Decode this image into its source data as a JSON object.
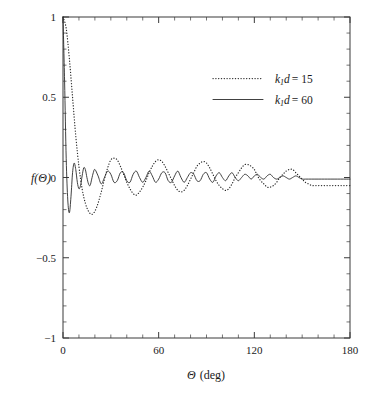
{
  "chart_data": {
    "type": "line",
    "title": "",
    "xlabel": "Θ (deg)",
    "xlabel_symbol": "Θ",
    "xlabel_unit": "(deg)",
    "ylabel": "f(Θ)",
    "xlim": [
      0,
      180
    ],
    "ylim": [
      -1,
      1
    ],
    "xticks": [
      0,
      60,
      120,
      180
    ],
    "xtick_labels": [
      "0",
      "60",
      "120",
      "180"
    ],
    "yticks": [
      -1,
      -0.5,
      0,
      0.5,
      1
    ],
    "ytick_labels": [
      "-1",
      "-0.5",
      "0",
      "0.5",
      "1"
    ],
    "x_minor_step": 10,
    "y_minor_step": 0.1,
    "grid": false,
    "tick_direction": "in",
    "legend_position": "upper right",
    "series": [
      {
        "name": "k1d = 15",
        "label_var": "k",
        "label_sub": "1",
        "label_var2": "d",
        "label_value": "= 15",
        "style": "dotted",
        "color": "#2b2b2b",
        "k1d": 15,
        "x": [
          0,
          2,
          4,
          6,
          8,
          10,
          12,
          14,
          16,
          18,
          20,
          22,
          24,
          26,
          28,
          30,
          32,
          34,
          36,
          38,
          40,
          42,
          44,
          46,
          48,
          50,
          52,
          54,
          56,
          58,
          60,
          62,
          64,
          66,
          68,
          70,
          72,
          74,
          76,
          78,
          80,
          82,
          84,
          86,
          88,
          90,
          92,
          94,
          96,
          98,
          100,
          102,
          104,
          106,
          108,
          110,
          112,
          114,
          116,
          118,
          120,
          122,
          124,
          126,
          128,
          130,
          132,
          134,
          136,
          138,
          140,
          142,
          144,
          146,
          148,
          150,
          152,
          154,
          156,
          158,
          160,
          162,
          164,
          166,
          168,
          170,
          172,
          174,
          176,
          178,
          180
        ],
        "y": [
          1.0,
          0.93,
          0.74,
          0.5,
          0.26,
          0.07,
          -0.07,
          -0.16,
          -0.21,
          -0.23,
          -0.21,
          -0.16,
          -0.09,
          -0.01,
          0.06,
          0.11,
          0.12,
          0.11,
          0.07,
          0.02,
          -0.03,
          -0.07,
          -0.1,
          -0.11,
          -0.09,
          -0.06,
          -0.02,
          0.03,
          0.07,
          0.1,
          0.11,
          0.1,
          0.07,
          0.03,
          -0.01,
          -0.05,
          -0.08,
          -0.09,
          -0.08,
          -0.05,
          -0.01,
          0.03,
          0.07,
          0.09,
          0.1,
          0.09,
          0.06,
          0.02,
          -0.02,
          -0.05,
          -0.07,
          -0.08,
          -0.07,
          -0.04,
          0.0,
          0.03,
          0.06,
          0.08,
          0.08,
          0.07,
          0.05,
          0.01,
          -0.02,
          -0.04,
          -0.06,
          -0.06,
          -0.05,
          -0.03,
          0.0,
          0.02,
          0.04,
          0.05,
          0.05,
          0.03,
          0.01,
          -0.01,
          -0.03,
          -0.04,
          -0.05,
          -0.05,
          -0.05,
          -0.05,
          -0.05,
          -0.05,
          -0.05,
          -0.05,
          -0.05,
          -0.05,
          -0.05,
          -0.05,
          -0.05
        ]
      },
      {
        "name": "k1d = 60",
        "label_var": "k",
        "label_sub": "1",
        "label_var2": "d",
        "label_value": "= 60",
        "style": "solid",
        "color": "#2b2b2b",
        "k1d": 60,
        "x": [
          0,
          1,
          2,
          3,
          4,
          5,
          6,
          7,
          8,
          9,
          10,
          11,
          12,
          13,
          14,
          15,
          16,
          17,
          18,
          19,
          20,
          22,
          24,
          26,
          28,
          30,
          32,
          34,
          36,
          38,
          40,
          42,
          44,
          46,
          48,
          50,
          52,
          54,
          56,
          58,
          60,
          62,
          64,
          66,
          68,
          70,
          72,
          74,
          76,
          78,
          80,
          82,
          84,
          86,
          88,
          90,
          92,
          94,
          96,
          98,
          100,
          102,
          104,
          106,
          108,
          110,
          112,
          114,
          116,
          118,
          120,
          122,
          124,
          126,
          128,
          130,
          132,
          134,
          136,
          138,
          140,
          142,
          144,
          146,
          148,
          150,
          152,
          154,
          156,
          158,
          160,
          162,
          164,
          166,
          168,
          170,
          172,
          174,
          176,
          178,
          180
        ],
        "y": [
          1.0,
          0.6,
          0.12,
          -0.14,
          -0.22,
          -0.12,
          0.03,
          0.09,
          0.05,
          -0.03,
          -0.07,
          -0.05,
          0.01,
          0.06,
          0.05,
          0.0,
          -0.04,
          -0.05,
          -0.01,
          0.03,
          0.05,
          0.01,
          -0.04,
          0.0,
          0.04,
          0.02,
          -0.03,
          -0.02,
          0.03,
          0.03,
          -0.02,
          -0.03,
          0.02,
          0.04,
          0.0,
          -0.03,
          0.0,
          0.04,
          0.01,
          -0.03,
          -0.01,
          0.03,
          0.03,
          -0.02,
          -0.03,
          0.01,
          0.04,
          0.0,
          -0.03,
          0.0,
          0.03,
          0.02,
          -0.02,
          -0.02,
          0.02,
          0.03,
          -0.01,
          -0.03,
          0.01,
          0.03,
          0.0,
          -0.02,
          0.01,
          0.03,
          0.0,
          -0.02,
          0.0,
          0.02,
          0.01,
          -0.01,
          0.01,
          0.02,
          0.0,
          -0.01,
          0.01,
          0.02,
          0.0,
          -0.01,
          0.0,
          0.01,
          0.0,
          -0.01,
          0.0,
          0.01,
          0.0,
          -0.01,
          -0.01,
          -0.01,
          -0.01,
          -0.01,
          -0.01,
          -0.01,
          -0.01,
          -0.01,
          -0.01,
          -0.01,
          -0.01,
          -0.01,
          -0.01,
          -0.01,
          -0.01
        ]
      }
    ]
  }
}
